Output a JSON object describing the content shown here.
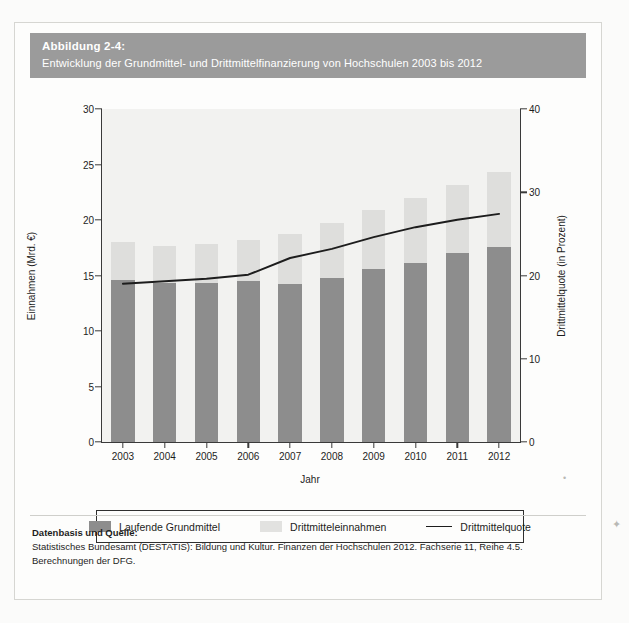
{
  "figure": {
    "number_label": "Abbildung 2-4:",
    "subtitle": "Entwicklung der Grundmittel- und Drittmittelfinanzierung von Hochschulen 2003 bis 2012"
  },
  "legend": {
    "items": [
      {
        "label": "Laufende Grundmittel",
        "swatch": "base-swatch",
        "color": "#8d8d8d"
      },
      {
        "label": "Drittmitteleinnahmen",
        "swatch": "third-party-swatch",
        "color": "#e2e2e0"
      },
      {
        "label": "Drittmittelquote",
        "swatch": "line-swatch",
        "color": "#1d1d1d"
      }
    ]
  },
  "source": {
    "heading": "Datenbasis und Quelle:",
    "line1": "Statistisches Bundesamt (DESTATIS): Bildung und Kultur. Finanzen der Hochschulen 2012. Fachserie 11, Reihe 4.5.",
    "line2": "Berechnungen der DFG."
  },
  "chart_data": {
    "type": "bar",
    "title": "Entwicklung der Grundmittel- und Drittmittelfinanzierung von Hochschulen 2003 bis 2012",
    "xlabel": "Jahr",
    "ylabel": "Einnahmen (Mrd. €)",
    "y2label": "Drittmittelquote (in Prozent)",
    "categories": [
      "2003",
      "2004",
      "2005",
      "2006",
      "2007",
      "2008",
      "2009",
      "2010",
      "2011",
      "2012"
    ],
    "ylim": [
      0,
      30
    ],
    "yticks": [
      0,
      5,
      10,
      15,
      20,
      25,
      30
    ],
    "y2lim": [
      0,
      40
    ],
    "y2ticks": [
      0,
      10,
      20,
      30,
      40
    ],
    "grid": false,
    "stacked": true,
    "legend_position": "bottom",
    "series": [
      {
        "name": "Laufende Grundmittel",
        "axis": "left",
        "kind": "bar",
        "color": "#8d8d8d",
        "values": [
          14.6,
          14.3,
          14.3,
          14.5,
          14.2,
          14.8,
          15.6,
          16.1,
          17.0,
          17.6
        ]
      },
      {
        "name": "Drittmitteleinnahmen",
        "axis": "left",
        "kind": "bar",
        "color": "#e2e2e0",
        "values": [
          3.4,
          3.4,
          3.5,
          3.7,
          4.5,
          4.9,
          5.3,
          5.9,
          6.2,
          6.7
        ]
      },
      {
        "name": "Drittmittelquote",
        "axis": "right",
        "kind": "line",
        "color": "#1d1d1d",
        "values": [
          19.0,
          19.3,
          19.6,
          20.1,
          22.1,
          23.2,
          24.6,
          25.8,
          26.7,
          27.4
        ]
      }
    ],
    "totals": [
      18.0,
      17.7,
      17.8,
      18.2,
      18.7,
      19.7,
      20.9,
      22.0,
      23.2,
      24.3
    ]
  }
}
